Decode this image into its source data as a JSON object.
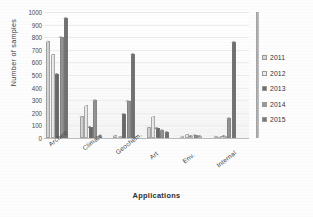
{
  "chart_data": {
    "type": "bar",
    "title": "",
    "xlabel": "Applications",
    "ylabel": "Number of samples",
    "ylim": [
      0,
      1000
    ],
    "yticks": [
      0,
      100,
      200,
      300,
      400,
      500,
      600,
      700,
      800,
      900,
      1000
    ],
    "grid": true,
    "legend_position": "right",
    "categories": [
      "Archeo",
      "Climate",
      "Geochem.",
      "Art",
      "Env.",
      "Internal"
    ],
    "series": [
      {
        "name": "2011",
        "color": "#d8d8d8",
        "values": [
          770,
          175,
          20,
          85,
          5,
          5
        ]
      },
      {
        "name": "2012",
        "color": "#eeeeee",
        "values": [
          670,
          265,
          10,
          175,
          30,
          3
        ]
      },
      {
        "name": "2013",
        "color": "#6e6e6e",
        "values": [
          510,
          85,
          190,
          80,
          12,
          4
        ]
      },
      {
        "name": "2014",
        "color": "#9a9a9a",
        "values": [
          800,
          300,
          290,
          60,
          25,
          155
        ]
      },
      {
        "name": "2015",
        "color": "#787878",
        "values": [
          950,
          15,
          670,
          50,
          10,
          760
        ]
      }
    ]
  },
  "legend": {
    "items": [
      {
        "label": "2011"
      },
      {
        "label": "2012"
      },
      {
        "label": "2013"
      },
      {
        "label": "2014"
      },
      {
        "label": "2015"
      }
    ]
  },
  "axes": {
    "y_title": "Number of samples",
    "x_title": "Applications",
    "y_tick_labels": [
      "1000",
      "900",
      "800",
      "700",
      "600",
      "500",
      "400",
      "300",
      "200",
      "100",
      "0"
    ],
    "x_tick_labels": [
      "Archeo",
      "Climate",
      "Geochem.",
      "Art",
      "Env.",
      "Internal"
    ]
  }
}
